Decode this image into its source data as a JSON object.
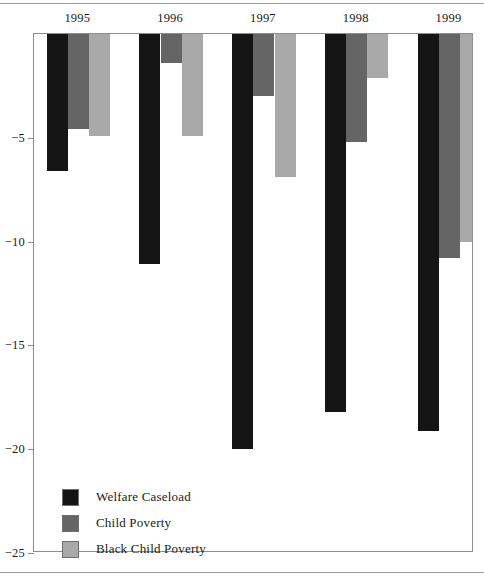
{
  "chart_data": {
    "type": "bar",
    "title": "",
    "subtitle": "",
    "xlabel": "",
    "ylabel": "",
    "categories": [
      "1995",
      "1996",
      "1997",
      "1998",
      "1999"
    ],
    "series": [
      {
        "name": "Welfare Caseload",
        "color": "#151515",
        "values": [
          -6.6,
          -11.1,
          -20.0,
          -18.2,
          -19.1
        ]
      },
      {
        "name": "Child Poverty",
        "color": "#656565",
        "values": [
          -4.6,
          -1.4,
          -3.0,
          -5.2,
          -10.8
        ]
      },
      {
        "name": "Black Child Poverty",
        "color": "#a9a9a9",
        "values": [
          -4.9,
          -4.9,
          -6.9,
          -2.1,
          -10.0
        ]
      }
    ],
    "ylim": [
      -25,
      0
    ],
    "yticks": [
      -5,
      -10,
      -15,
      -20,
      -25
    ],
    "ytick_labels": [
      "−5",
      "−10",
      "−15",
      "−20",
      "−25"
    ],
    "grid": false,
    "legend_position": "inside-bottom-left",
    "orientation": "vertical",
    "bar_direction": "downward-from-zero"
  },
  "legend": {
    "items": [
      {
        "label": "Welfare Caseload",
        "swatch": "legend-swatch-welfare-caseload"
      },
      {
        "label": "Child Poverty",
        "swatch": "legend-swatch-child-poverty"
      },
      {
        "label": "Black Child Poverty",
        "swatch": "legend-swatch-black-child-poverty"
      }
    ]
  },
  "axes": {
    "x_labels": [
      "1995",
      "1996",
      "1997",
      "1998",
      "1999"
    ],
    "y_labels": [
      "−5",
      "−10",
      "−15",
      "−20",
      "−25"
    ]
  }
}
